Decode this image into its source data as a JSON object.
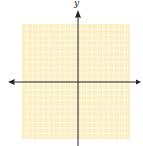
{
  "diagram": {
    "type": "coordinate-plane",
    "x_axis_label": "",
    "y_axis_label": "y",
    "grid": {
      "columns": 20,
      "rows": 21,
      "fill_color": "#fbefc2",
      "line_color": "#ffffff"
    },
    "axis_color": "#222222",
    "arrows": [
      "left",
      "right",
      "up"
    ]
  }
}
